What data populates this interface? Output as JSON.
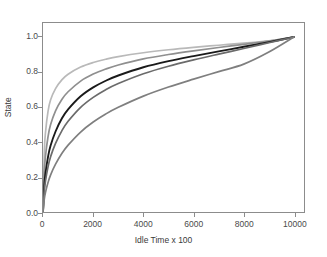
{
  "chart_data": {
    "type": "line",
    "title": "",
    "xlabel": "Idle Time x 100",
    "ylabel": "State",
    "xlim": [
      0,
      10400
    ],
    "ylim": [
      0,
      1.08
    ],
    "xticks": [
      0,
      2000,
      4000,
      6000,
      8000,
      10000
    ],
    "xtick_labels": [
      "0",
      "2000",
      "4000",
      "6000",
      "8000",
      "10000"
    ],
    "yticks": [
      0.0,
      0.2,
      0.4,
      0.6,
      0.8,
      1.0
    ],
    "ytick_labels": [
      "0.0",
      "0.2",
      "0.4",
      "0.6",
      "0.8",
      "1.0"
    ],
    "grid": false,
    "legend": "none",
    "frame_color": "#8c8c8c",
    "background": "#ffffff",
    "x": [
      0,
      50,
      100,
      200,
      300,
      500,
      750,
      1000,
      1500,
      2000,
      2500,
      3000,
      4000,
      5000,
      6000,
      7000,
      8000,
      9000,
      10000
    ],
    "series": [
      {
        "name": "curve-1",
        "color": "#b9b9b9",
        "linewidth": 1.7,
        "values": [
          0.0,
          0.335,
          0.455,
          0.575,
          0.64,
          0.705,
          0.755,
          0.787,
          0.828,
          0.854,
          0.873,
          0.888,
          0.91,
          0.927,
          0.941,
          0.953,
          0.965,
          0.978,
          1.0
        ]
      },
      {
        "name": "curve-2",
        "color": "#8f8f8f",
        "linewidth": 1.7,
        "values": [
          0.0,
          0.225,
          0.32,
          0.43,
          0.498,
          0.578,
          0.643,
          0.687,
          0.748,
          0.788,
          0.817,
          0.84,
          0.875,
          0.9,
          0.921,
          0.94,
          0.958,
          0.977,
          1.0
        ]
      },
      {
        "name": "curve-3",
        "color": "#1a1a1a",
        "linewidth": 1.9,
        "values": [
          0.0,
          0.15,
          0.222,
          0.315,
          0.378,
          0.46,
          0.534,
          0.586,
          0.661,
          0.712,
          0.75,
          0.78,
          0.827,
          0.862,
          0.891,
          0.918,
          0.944,
          0.971,
          1.0
        ]
      },
      {
        "name": "curve-4",
        "color": "#6b6b6b",
        "linewidth": 1.7,
        "values": [
          0.0,
          0.118,
          0.178,
          0.258,
          0.315,
          0.392,
          0.464,
          0.518,
          0.598,
          0.655,
          0.699,
          0.734,
          0.79,
          0.833,
          0.869,
          0.902,
          0.934,
          0.967,
          1.0
        ]
      },
      {
        "name": "curve-5",
        "color": "#7f7f7f",
        "linewidth": 1.7,
        "values": [
          0.0,
          0.072,
          0.112,
          0.168,
          0.211,
          0.273,
          0.334,
          0.382,
          0.457,
          0.514,
          0.56,
          0.598,
          0.662,
          0.714,
          0.759,
          0.802,
          0.845,
          0.914,
          1.0
        ]
      }
    ]
  }
}
